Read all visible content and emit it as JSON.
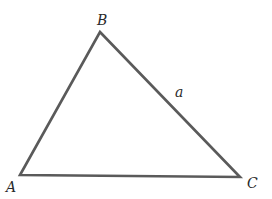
{
  "diagram": {
    "type": "triangle",
    "stroke_color": "#5a5a5a",
    "vertices": [
      {
        "name": "A",
        "x": 20,
        "y": 175
      },
      {
        "name": "B",
        "x": 100,
        "y": 32
      },
      {
        "name": "C",
        "x": 240,
        "y": 177
      }
    ],
    "labels": {
      "vertex_a": "A",
      "vertex_b": "B",
      "vertex_c": "C",
      "side_bc": "a"
    }
  }
}
